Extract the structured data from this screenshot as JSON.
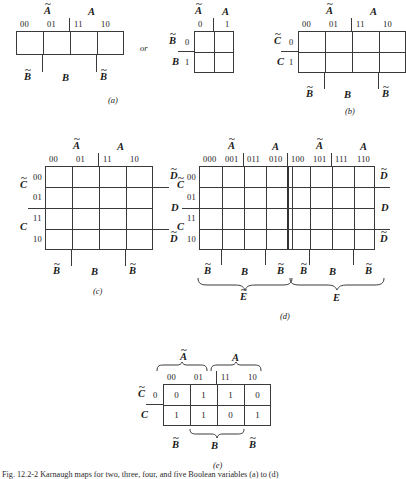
{
  "figure": {
    "caption": "Fig. 12.2-2  Karnaugh maps for two, three, four, and five Boolean variables (a) to (d)",
    "connector_or": "or"
  },
  "panels": {
    "a": {
      "label": "(a)",
      "map1": {
        "top_groups": [
          "A",
          "A"
        ],
        "col_headers": [
          "00",
          "01",
          "11",
          "10"
        ],
        "bottom_labels": [
          "B",
          "B",
          "B"
        ],
        "rows": 1,
        "cols": 4
      },
      "map2": {
        "top_groups": [
          "A",
          "A"
        ],
        "col_headers": [
          "0",
          "1"
        ],
        "row_vars": [
          "B",
          "B"
        ],
        "row_headers": [
          "0",
          "1"
        ],
        "rows": 2,
        "cols": 2
      }
    },
    "b": {
      "label": "(b)",
      "top_groups": [
        "A",
        "A"
      ],
      "col_headers": [
        "00",
        "01",
        "11",
        "10"
      ],
      "row_vars": [
        "C",
        "C"
      ],
      "row_headers": [
        "0",
        "1"
      ],
      "bottom_labels": [
        "B",
        "B",
        "B"
      ],
      "rows": 2,
      "cols": 4
    },
    "c": {
      "label": "(c)",
      "top_groups": [
        "A",
        "A"
      ],
      "col_headers": [
        "00",
        "01",
        "11",
        "10"
      ],
      "row_vars": [
        "C",
        "C"
      ],
      "row_headers": [
        "00",
        "01",
        "11",
        "10"
      ],
      "right_labels": [
        "D",
        "D",
        "D"
      ],
      "bottom_labels": [
        "B",
        "B",
        "B"
      ],
      "rows": 4,
      "cols": 4
    },
    "d": {
      "label": "(d)",
      "top_groups": [
        "A",
        "A",
        "A",
        "A"
      ],
      "col_headers": [
        "000",
        "001",
        "011",
        "010",
        "100",
        "101",
        "111",
        "110"
      ],
      "row_vars": [
        "C",
        "C"
      ],
      "row_headers": [
        "00",
        "01",
        "11",
        "10"
      ],
      "right_labels": [
        "D",
        "D",
        "D"
      ],
      "bottom_labels": [
        "B",
        "B",
        "B",
        "B",
        "B",
        "B"
      ],
      "brace_labels": [
        "E",
        "E"
      ],
      "rows": 4,
      "cols": 8
    },
    "e": {
      "label": "(e)",
      "top_groups": [
        "A",
        "A"
      ],
      "col_headers": [
        "00",
        "01",
        "11",
        "10"
      ],
      "row_vars": [
        "C",
        "C"
      ],
      "row_headers": [
        "0",
        "1"
      ],
      "bottom_labels": [
        "B",
        "B",
        "B"
      ],
      "rows": 2,
      "cols": 4,
      "values": [
        [
          "0",
          "1",
          "1",
          "0"
        ],
        [
          "1",
          "1",
          "0",
          "1"
        ]
      ]
    }
  }
}
